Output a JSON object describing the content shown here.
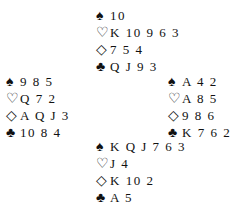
{
  "hands": {
    "north": {
      "spades": "10",
      "hearts": "K 10 9 6 3",
      "diamonds": "7 5 4",
      "clubs": "Q J 9 3"
    },
    "west": {
      "spades": "9 8 5",
      "hearts": "Q 7 2",
      "diamonds": "A Q J 3",
      "clubs": "10 8 4"
    },
    "east": {
      "spades": "A 4 2",
      "hearts": "A 8 5",
      "diamonds": "9 8 6",
      "clubs": "K 7 6 2"
    },
    "south": {
      "spades": "K Q J 7 6 3",
      "hearts": "J 4",
      "diamonds": "K 10 2",
      "clubs": "A 5"
    }
  },
  "symbols": {
    "spades": "♠",
    "hearts": "♡",
    "diamonds": "◇",
    "clubs": "♣"
  }
}
